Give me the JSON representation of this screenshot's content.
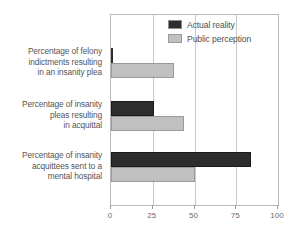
{
  "chart_data": {
    "type": "bar",
    "orientation": "horizontal",
    "title": "",
    "subtitle": "",
    "xlabel": "",
    "ylabel": "",
    "xlim": [
      0,
      100
    ],
    "xticks": [
      0,
      25,
      50,
      75,
      100
    ],
    "xtick_labels": [
      "0",
      "25",
      "50",
      "75",
      "100"
    ],
    "grid": true,
    "grid_axis": "x",
    "legend_position": "top-right",
    "categories": [
      "Percentage of felony indictments resulting in an insanity plea",
      "Percentage of insanity pleas resulting in acquittal",
      "Percentage of insanity acquittees sent to a mental hospital"
    ],
    "series": [
      {
        "name": "Actual reality",
        "values": [
          1,
          26,
          84
        ],
        "color": "#2d2d2d"
      },
      {
        "name": "Public perception",
        "values": [
          38,
          44,
          50
        ],
        "color": "#c0c0c0"
      }
    ]
  },
  "category_labels": [
    {
      "lines": [
        "Percentage of felony",
        "indictments resulting",
        "in an insanity plea"
      ]
    },
    {
      "lines": [
        "Percentage of insanity",
        "pleas resulting",
        "in acquittal"
      ]
    },
    {
      "lines": [
        "Percentage of insanity",
        "acquittees sent to a",
        "mental hospital"
      ]
    }
  ],
  "legend": {
    "items": [
      {
        "label": "Actual reality",
        "swatch": "dark-swatch-icon"
      },
      {
        "label": "Public perception",
        "swatch": "light-swatch-icon"
      }
    ]
  },
  "axis": {
    "tick_labels": [
      "0",
      "25",
      "50",
      "75",
      "100"
    ]
  },
  "colors": {
    "actual_reality": "#2d2d2d",
    "public_perception": "#c0c0c0",
    "frame": "#b9b9b9",
    "gridline": "#c9c9c9",
    "text": "#555555",
    "background": "#ffffff"
  }
}
